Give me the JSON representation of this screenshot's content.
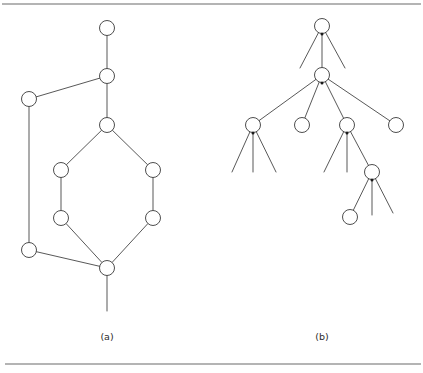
{
  "figure": {
    "width": 423,
    "height": 373,
    "background": "#ffffff",
    "line_color": "#3a3a3a",
    "rule_color": "#6b6b6b",
    "node_fill": "#ffffff",
    "node_radius": 7.5,
    "rules": [
      {
        "name": "top-rule",
        "x1": 2,
        "y1": 4,
        "x2": 421,
        "y2": 4
      },
      {
        "name": "bottom-rule",
        "x1": 5,
        "y1": 364,
        "x2": 421,
        "y2": 364
      }
    ],
    "captions": [
      {
        "name": "caption-a",
        "text": "(a)",
        "x": 107,
        "y": 337
      },
      {
        "name": "caption-b",
        "text": "(b)",
        "x": 322,
        "y": 337
      }
    ],
    "panels": [
      {
        "id": "panel-a",
        "label": "(a)",
        "type": "graph",
        "nodes": [
          {
            "id": "a1",
            "x": 107,
            "y": 28
          },
          {
            "id": "a2",
            "x": 107,
            "y": 76
          },
          {
            "id": "a3",
            "x": 29,
            "y": 99
          },
          {
            "id": "a4",
            "x": 107,
            "y": 125
          },
          {
            "id": "a5",
            "x": 61,
            "y": 170
          },
          {
            "id": "a6",
            "x": 153,
            "y": 170
          },
          {
            "id": "a7",
            "x": 61,
            "y": 218
          },
          {
            "id": "a8",
            "x": 153,
            "y": 218
          },
          {
            "id": "a9",
            "x": 29,
            "y": 250
          },
          {
            "id": "a10",
            "x": 107,
            "y": 268
          }
        ],
        "edges": [
          {
            "from": "a1",
            "to": "a2"
          },
          {
            "from": "a2",
            "to": "a3"
          },
          {
            "from": "a2",
            "to": "a4"
          },
          {
            "from": "a3",
            "to": "a9"
          },
          {
            "from": "a4",
            "to": "a5"
          },
          {
            "from": "a4",
            "to": "a6"
          },
          {
            "from": "a5",
            "to": "a7"
          },
          {
            "from": "a6",
            "to": "a8"
          },
          {
            "from": "a7",
            "to": "a10"
          },
          {
            "from": "a8",
            "to": "a10"
          },
          {
            "from": "a9",
            "to": "a10"
          }
        ],
        "stubs": [
          {
            "from": "a10",
            "x2": 107,
            "y2": 311
          }
        ],
        "junctions": []
      },
      {
        "id": "panel-b",
        "label": "(b)",
        "type": "tree",
        "nodes": [
          {
            "id": "b1",
            "x": 322,
            "y": 26
          },
          {
            "id": "b2",
            "x": 322,
            "y": 75
          },
          {
            "id": "b3",
            "x": 253,
            "y": 125
          },
          {
            "id": "b4",
            "x": 302,
            "y": 125
          },
          {
            "id": "b5",
            "x": 347,
            "y": 125
          },
          {
            "id": "b6",
            "x": 396,
            "y": 125
          },
          {
            "id": "b7",
            "x": 372,
            "y": 172
          },
          {
            "id": "b8",
            "x": 350,
            "y": 217
          }
        ],
        "edges": [
          {
            "from": "b1",
            "to": "b2"
          },
          {
            "from": "b2",
            "to": "b3"
          },
          {
            "from": "b2",
            "to": "b4"
          },
          {
            "from": "b2",
            "to": "b5"
          },
          {
            "from": "b2",
            "to": "b6"
          },
          {
            "from": "b5",
            "to": "b7"
          },
          {
            "from": "b7",
            "to": "b8"
          }
        ],
        "stubs": [
          {
            "from": "b1",
            "x2": 300,
            "y2": 68
          },
          {
            "from": "b1",
            "x2": 345,
            "y2": 68
          },
          {
            "from": "b3",
            "x2": 232,
            "y2": 172
          },
          {
            "from": "b3",
            "x2": 253,
            "y2": 172
          },
          {
            "from": "b3",
            "x2": 276,
            "y2": 172
          },
          {
            "from": "b5",
            "x2": 324,
            "y2": 172
          },
          {
            "from": "b5",
            "x2": 347,
            "y2": 172
          },
          {
            "from": "b7",
            "x2": 372,
            "y2": 215
          },
          {
            "from": "b7",
            "x2": 393,
            "y2": 213
          }
        ],
        "junctions": [
          {
            "x": 322,
            "y": 34
          },
          {
            "x": 322,
            "y": 83
          },
          {
            "x": 253,
            "y": 133
          },
          {
            "x": 347,
            "y": 133
          },
          {
            "x": 372,
            "y": 180
          }
        ]
      }
    ]
  }
}
